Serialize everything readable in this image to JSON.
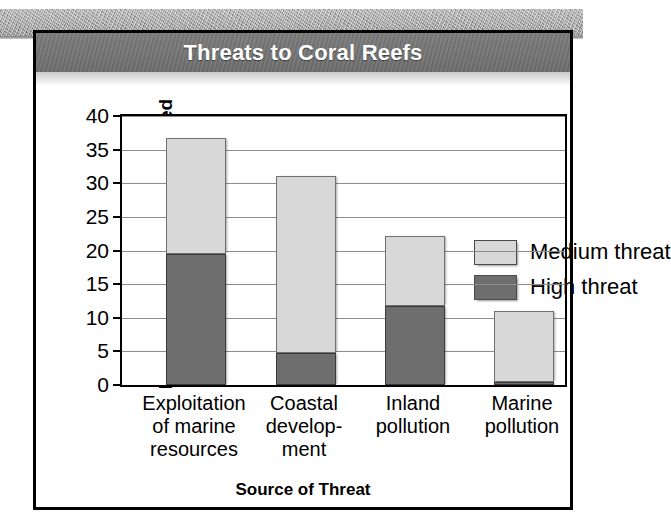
{
  "figure": {
    "title": "Threats to Coral Reefs"
  },
  "colors": {
    "title_bar": "#757575",
    "title_text": "#ffffff",
    "high_threat": "#6e6e6e",
    "medium_threat": "#d8d8d8",
    "gridline": "#8d8d8d",
    "axis": "#000000",
    "background": "#ffffff"
  },
  "chart_data": {
    "type": "bar",
    "subtype": "stacked",
    "title": "Threats to Coral Reefs",
    "xlabel": "Source of Threat",
    "ylabel": "Percentage of Reefs Threatened",
    "categories": [
      "Exploitation of marine resources",
      "Coastal development",
      "Inland pollution",
      "Marine pollution"
    ],
    "category_label_lines": [
      [
        "Exploitation",
        "of marine",
        "resources"
      ],
      [
        "Coastal",
        "develop-",
        "ment"
      ],
      [
        "Inland",
        "pollution"
      ],
      [
        "Marine",
        "pollution"
      ]
    ],
    "series": [
      {
        "name": "High threat",
        "color": "#6e6e6e",
        "values": [
          19.5,
          4.8,
          11.7,
          0.5
        ]
      },
      {
        "name": "Medium threat",
        "color": "#d8d8d8",
        "values": [
          17.3,
          26.3,
          10.5,
          10.5
        ]
      }
    ],
    "totals": [
      36.8,
      31.1,
      22.2,
      11.0
    ],
    "ylim": [
      0,
      40
    ],
    "ytick_labels": [
      "0",
      "5",
      "10",
      "15",
      "20",
      "25",
      "30",
      "35",
      "40"
    ],
    "ytick_values": [
      0,
      5,
      10,
      15,
      20,
      25,
      30,
      35,
      40
    ],
    "grid": true,
    "grid_axis": "y",
    "legend": {
      "position": "inside-top-right",
      "entries": [
        {
          "label": "Medium threat",
          "color": "#d8d8d8"
        },
        {
          "label": "High threat",
          "color": "#6e6e6e"
        }
      ]
    }
  }
}
